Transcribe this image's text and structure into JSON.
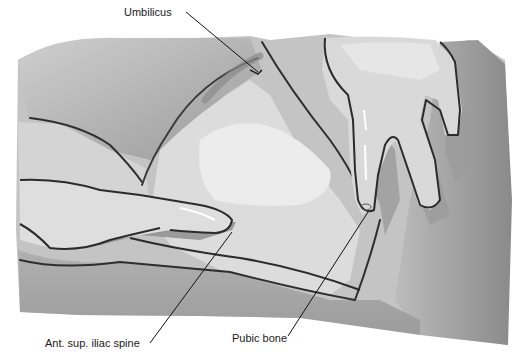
{
  "figure": {
    "style": "grayscale illustration",
    "labels": {
      "umbilicus": "Umbilicus",
      "asis": "Ant. sup. iliac spine",
      "pubic_bone": "Pubic bone"
    },
    "colors": {
      "background": "#ffffff",
      "outline": "#2b2b2b",
      "skin_light": "#e4e4e4",
      "skin_mid": "#bdbdbd",
      "skin_dark": "#8e8e8e",
      "leader_line": "#111111"
    }
  }
}
